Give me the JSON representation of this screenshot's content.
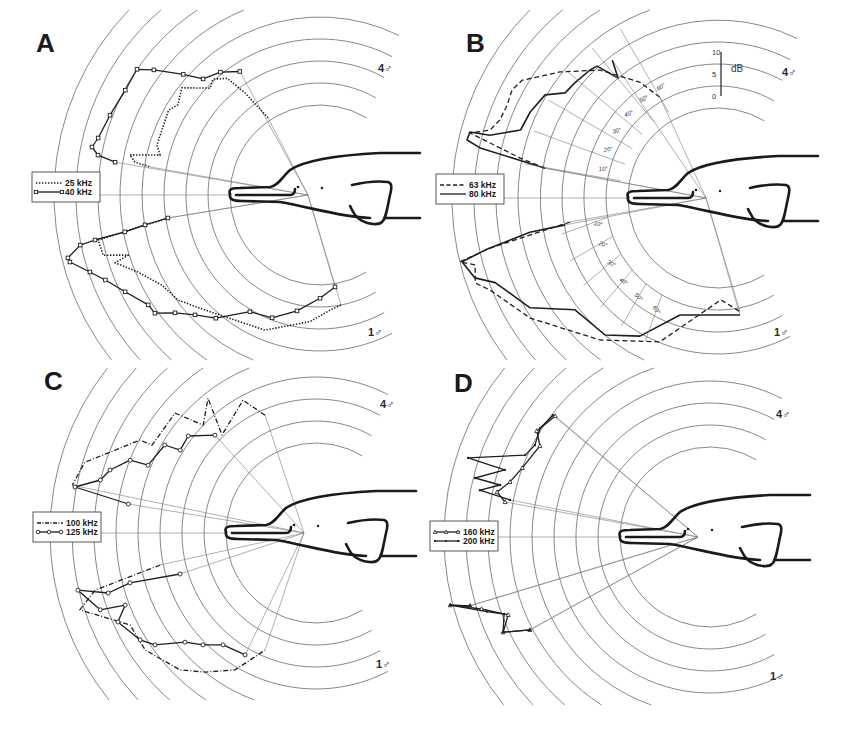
{
  "figure": {
    "panel_letters": [
      "A",
      "B",
      "C",
      "D"
    ],
    "sex_labels": {
      "top": "4♂",
      "bottom": "1♂"
    },
    "db_scale": {
      "unit": "dB",
      "ticks": [
        "0",
        "5",
        "10"
      ]
    },
    "angle_labels": {
      "upper": [
        "10°",
        "20°",
        "30°",
        "40°",
        "50°",
        "60°"
      ],
      "lower": [
        "10°",
        "20°",
        "30°",
        "40°",
        "50°",
        "60°"
      ]
    }
  },
  "chart_data": [
    {
      "type": "polar",
      "panel": "A",
      "title": "A",
      "angle_unit": "degrees from rostrum axis (+ up, − down)",
      "radius_unit": "dB above innermost ring (5 dB per ring)",
      "rings_db": [
        0,
        5,
        10,
        15,
        20,
        25,
        30,
        35,
        40
      ],
      "legend": [
        "25 kHz",
        "40 kHz"
      ],
      "series": [
        {
          "name": "25 kHz",
          "style": "dotted",
          "marker": "none",
          "upper": [
            [
              56,
              0.7
            ],
            [
              53.7,
              8.3
            ],
            [
              51.5,
              13.4
            ],
            [
              47.3,
              15.4
            ],
            [
              44.2,
              14.4
            ],
            [
              37.8,
              19.3
            ],
            [
              32.4,
              17.8
            ],
            [
              29.2,
              19
            ],
            [
              23.1,
              18.4
            ],
            [
              17,
              18.3
            ],
            [
              14,
              17
            ],
            [
              11.9,
              23.7
            ],
            [
              10.1,
              22.3
            ],
            [
              9.4,
              18.7
            ]
          ],
          "lower": [
            [
              -8.6,
              14.5
            ],
            [
              -11.5,
              31
            ],
            [
              -15.5,
              30.7
            ],
            [
              -17.4,
              25.2
            ],
            [
              -18.3,
              28.6
            ],
            [
              -22.9,
              24.5
            ],
            [
              -29.7,
              20.9
            ],
            [
              -36.5,
              19.7
            ],
            [
              -45,
              16.5
            ],
            [
              -67.8,
              12.7
            ],
            [
              -85.5,
              8.4
            ],
            [
              -95,
              5.8
            ],
            [
              -100.8,
              5
            ]
          ]
        },
        {
          "name": "40 kHz",
          "style": "solid",
          "marker": "square",
          "upper": [
            [
              57,
              13
            ],
            [
              51,
              15.5
            ],
            [
              44.8,
              17
            ],
            [
              41.4,
              21
            ],
            [
              37,
              26.8
            ],
            [
              34.5,
              30
            ],
            [
              28.3,
              29.8
            ],
            [
              20.8,
              30.6
            ],
            [
              14.4,
              31.6
            ],
            [
              11.9,
              32.5
            ],
            [
              10.2,
              30.8
            ],
            [
              9.1,
              26.7
            ]
          ],
          "lower": [
            [
              -8.6,
              14.5
            ],
            [
              -9.7,
              19.9
            ],
            [
              -10.7,
              24.7
            ],
            [
              -11.3,
              31.7
            ],
            [
              -11.8,
              35.2
            ],
            [
              -14,
              38.6
            ],
            [
              -15,
              38.4
            ],
            [
              -18.5,
              34.7
            ],
            [
              -21.6,
              32
            ],
            [
              -26.4,
              29
            ],
            [
              -32.6,
              25.9
            ],
            [
              -35.6,
              25.7
            ],
            [
              -39.1,
              22
            ],
            [
              -43.8,
              18.9
            ],
            [
              -49.8,
              16.2
            ],
            [
              -59,
              10.5
            ],
            [
              -68.7,
              9.5
            ],
            [
              -78.8,
              6.4
            ],
            [
              -90,
              3
            ],
            [
              -99.3,
              0.7
            ]
          ]
        }
      ]
    },
    {
      "type": "polar",
      "panel": "B",
      "title": "B",
      "angle_unit": "degrees from rostrum axis (+ up, − down)",
      "radius_unit": "dB above innermost ring (5 dB per ring)",
      "rings_db": [
        0,
        5,
        10,
        15,
        20,
        25,
        30,
        35,
        40
      ],
      "legend": [
        "63 kHz",
        "80 kHz"
      ],
      "series": [
        {
          "name": "63 kHz",
          "style": "dashed",
          "marker": "none",
          "upper": [
            [
              60,
              6
            ],
            [
              56,
              11.3
            ],
            [
              47.3,
              19.1
            ],
            [
              38.6,
              25.5
            ],
            [
              31,
              31.5
            ],
            [
              27.7,
              32.4
            ],
            [
              23.8,
              31.9
            ],
            [
              19.7,
              32.2
            ],
            [
              16.6,
              33.6
            ],
            [
              14.7,
              37.8
            ],
            [
              11.4,
              25.4
            ],
            [
              9.8,
              19.4
            ]
          ],
          "lower": [
            [
              -9.2,
              13.6
            ],
            [
              -12.4,
              32.6
            ],
            [
              -13.9,
              40
            ],
            [
              -15.4,
              36.8
            ],
            [
              -19.3,
              38
            ],
            [
              -22,
              35.4
            ],
            [
              -32.6,
              30.2
            ],
            [
              -50.3,
              21.5
            ],
            [
              -68,
              14.8
            ],
            [
              -91.7,
              2.7
            ],
            [
              -101,
              5.9
            ]
          ]
        },
        {
          "name": "80 kHz",
          "style": "solid",
          "marker": "none",
          "upper": [
            [
              52.5,
              19
            ],
            [
              50.2,
              15
            ],
            [
              47.5,
              20.2
            ],
            [
              45,
              20.7
            ],
            [
              38.8,
              21.3
            ],
            [
              34.5,
              21.7
            ],
            [
              30.8,
              25.3
            ],
            [
              24.6,
              26.5
            ],
            [
              19,
              27
            ],
            [
              15.4,
              33.3
            ],
            [
              14.9,
              37.9
            ],
            [
              13,
              38.1
            ],
            [
              11.9,
              34.8
            ],
            [
              9.8,
              19.4
            ]
          ],
          "lower": [
            [
              -10,
              14.8
            ],
            [
              -10.3,
              23
            ],
            [
              -12.6,
              33.8
            ],
            [
              -14,
              39.5
            ],
            [
              -18.2,
              37.7
            ],
            [
              -20.8,
              33.7
            ],
            [
              -30.3,
              29
            ],
            [
              -38,
              20.8
            ],
            [
              -50.5,
              19.9
            ],
            [
              -60.5,
              15.6
            ],
            [
              -72,
              7.5
            ],
            [
              -100.6,
              6.6
            ]
          ]
        }
      ]
    },
    {
      "type": "polar",
      "panel": "C",
      "title": "C",
      "angle_unit": "degrees from rostrum axis (+ up, − down)",
      "radius_unit": "dB above innermost ring (5 dB per ring)",
      "rings_db": [
        0,
        5,
        10,
        15,
        20,
        25,
        30,
        35,
        40
      ],
      "legend": [
        "100 kHz",
        "125 kHz"
      ],
      "series": [
        {
          "name": "100 kHz",
          "style": "dashdot",
          "marker": "none",
          "upper": [
            [
              66.6,
              8.7
            ],
            [
              61.2,
              14
            ],
            [
              46.2,
              10.4
            ],
            [
              51.3,
              18.8
            ],
            [
              43.7,
              15
            ],
            [
              40.4,
              21.6
            ],
            [
              28.2,
              21.8
            ],
            [
              27.8,
              24.8
            ],
            [
              17,
              34.5
            ],
            [
              11.1,
              36
            ]
          ],
          "lower": [
            [
              -11.6,
              15.7
            ],
            [
              -14.5,
              31.4
            ],
            [
              -18,
              36
            ],
            [
              -26.3,
              26.7
            ],
            [
              -34.4,
              26.6
            ],
            [
              -45.2,
              23.4
            ],
            [
              -51.4,
              20
            ],
            [
              -59.4,
              15.7
            ],
            [
              -66.5,
              8.6
            ]
          ]
        },
        {
          "name": "125 kHz",
          "style": "solid",
          "marker": "circle",
          "upper": [
            [
              44.1,
              11.5
            ],
            [
              37.2,
              16
            ],
            [
              31.4,
              15.7
            ],
            [
              30.2,
              19.3
            ],
            [
              22,
              20.7
            ],
            [
              21.4,
              24.9
            ],
            [
              17,
              28.5
            ],
            [
              13.8,
              30
            ],
            [
              10.8,
              35.3
            ],
            [
              8.8,
              22.7
            ]
          ],
          "lower": [
            [
              -16.8,
              11.8
            ],
            [
              -15,
              23.3
            ],
            [
              -16.1,
              28.7
            ],
            [
              -13.5,
              35.2
            ],
            [
              -19.6,
              31.6
            ],
            [
              -20.7,
              25.9
            ],
            [
              -24.2,
              28.9
            ],
            [
              -31.3,
              26.3
            ],
            [
              -34.8,
              24.1
            ],
            [
              -39.8,
              18.3
            ],
            [
              -44.7,
              15.7
            ],
            [
              -50.3,
              12.6
            ],
            [
              -59.8,
              11.6
            ]
          ]
        }
      ]
    },
    {
      "type": "polar",
      "panel": "D",
      "title": "D",
      "angle_unit": "degrees from rostrum axis (+ up, − down)",
      "radius_unit": "dB above innermost ring (5 dB per ring)",
      "rings_db": [
        0,
        5,
        10,
        15,
        20,
        25,
        30,
        35,
        40
      ],
      "legend": [
        "160 kHz",
        "200 kHz"
      ],
      "series": [
        {
          "name": "160 kHz",
          "style": "solid",
          "marker": "triangle",
          "upper": [
            [
              38,
              24.2
            ],
            [
              31.5,
              25.7
            ],
            [
              28.2,
              23.4
            ],
            [
              20.2,
              25
            ],
            [
              15.4,
              26.7
            ],
            [
              11.9,
              29
            ],
            [
              9.7,
              26.8
            ]
          ],
          "lower": [
            [
              -16,
              36.3
            ],
            [
              -14.7,
              40.6
            ],
            [
              -17.5,
              34
            ],
            [
              -21.1,
              28.7
            ],
            [
              -24.7,
              31.3
            ],
            [
              -27.3,
              25.6
            ]
          ]
        },
        {
          "name": "200 kHz",
          "style": "solid",
          "marker": "dot",
          "upper": [
            [
              37.8,
              24.7
            ],
            [
              32.7,
              25.4
            ],
            [
              27.7,
              24.5
            ],
            [
              23.9,
              25.5
            ],
            [
              18.1,
              37.4
            ],
            [
              18.1,
              28.6
            ],
            [
              14.1,
              34.6
            ],
            [
              13.9,
              28.7
            ],
            [
              11.5,
              32.9
            ],
            [
              10.5,
              25.8
            ]
          ],
          "lower": [
            [
              -16,
              36.3
            ],
            [
              -14.7,
              40.6
            ],
            [
              -18.5,
              33
            ],
            [
              -20.5,
              29.5
            ],
            [
              -24.7,
              31.3
            ],
            [
              -27.3,
              25.6
            ]
          ]
        }
      ]
    }
  ]
}
